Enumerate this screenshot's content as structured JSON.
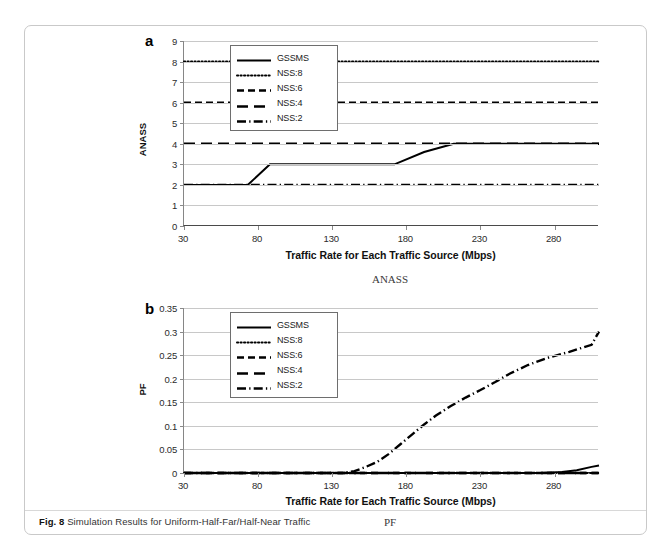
{
  "figure": {
    "caption_bold": "Fig. 8",
    "caption_text": "Simulation Results for Uniform-Half-Far/Half-Near Traffic"
  },
  "panels": [
    {
      "letter": "a",
      "sublabel": "ANASS",
      "axis_title_x": "Traffic Rate for Each Traffic Source (Mbps)",
      "axis_title_y": "ANASS",
      "ytick_labels": [
        "9",
        "8",
        "7",
        "6",
        "5",
        "4",
        "3",
        "2",
        "1",
        "0"
      ],
      "xtick_labels": [
        "30",
        "80",
        "130",
        "180",
        "230",
        "280"
      ],
      "legend": [
        {
          "label": "GSSMS",
          "style": "solid"
        },
        {
          "label": "NSS:8",
          "style": "dotted"
        },
        {
          "label": "NSS:6",
          "style": "dashed"
        },
        {
          "label": "NSS:4",
          "style": "longdash"
        },
        {
          "label": "NSS:2",
          "style": "dashdot"
        }
      ]
    },
    {
      "letter": "b",
      "sublabel": "PF",
      "axis_title_x": "Traffic Rate for Each Traffic Source (Mbps)",
      "axis_title_y": "PF",
      "ytick_labels": [
        "0.35",
        "0.3",
        "0.25",
        "0.2",
        "0.15",
        "0.1",
        "0.05",
        "0"
      ],
      "xtick_labels": [
        "30",
        "80",
        "130",
        "180",
        "230",
        "280"
      ],
      "legend": [
        {
          "label": "GSSMS",
          "style": "solid"
        },
        {
          "label": "NSS:8",
          "style": "dotted"
        },
        {
          "label": "NSS:6",
          "style": "dashed"
        },
        {
          "label": "NSS:4",
          "style": "longdash"
        },
        {
          "label": "NSS:2",
          "style": "dashdot"
        }
      ]
    }
  ],
  "chart_data": [
    {
      "type": "line",
      "title": "ANASS",
      "panel": "a",
      "xlabel": "Traffic Rate for Each Traffic Source (Mbps)",
      "ylabel": "ANASS",
      "xlim": [
        30,
        310
      ],
      "ylim": [
        0,
        9
      ],
      "yticks": [
        0,
        1,
        2,
        3,
        4,
        5,
        6,
        7,
        8,
        9
      ],
      "xticks": [
        30,
        80,
        130,
        180,
        230,
        280
      ],
      "grid": true,
      "legend_position": "top-left-inside",
      "series": [
        {
          "name": "GSSMS",
          "style": "solid",
          "x": [
            30,
            73,
            88,
            172,
            192,
            212,
            310
          ],
          "values": [
            2,
            2,
            3,
            3,
            3.6,
            4,
            4
          ]
        },
        {
          "name": "NSS:8",
          "style": "dotted",
          "x": [
            30,
            310
          ],
          "values": [
            8,
            8
          ]
        },
        {
          "name": "NSS:6",
          "style": "dashed",
          "x": [
            30,
            310
          ],
          "values": [
            6,
            6
          ]
        },
        {
          "name": "NSS:4",
          "style": "longdash",
          "x": [
            30,
            310
          ],
          "values": [
            4,
            4
          ]
        },
        {
          "name": "NSS:2",
          "style": "dashdot",
          "x": [
            30,
            310
          ],
          "values": [
            2,
            2
          ]
        }
      ]
    },
    {
      "type": "line",
      "title": "PF",
      "panel": "b",
      "xlabel": "Traffic Rate for Each Traffic Source (Mbps)",
      "ylabel": "PF",
      "xlim": [
        30,
        310
      ],
      "ylim": [
        0,
        0.35
      ],
      "yticks": [
        0,
        0.05,
        0.1,
        0.15,
        0.2,
        0.25,
        0.3,
        0.35
      ],
      "xticks": [
        30,
        80,
        130,
        180,
        230,
        280
      ],
      "grid": true,
      "legend_position": "top-left-inside",
      "series": [
        {
          "name": "GSSMS",
          "style": "solid",
          "x": [
            30,
            130,
            230,
            270,
            285,
            295,
            305,
            310
          ],
          "values": [
            0,
            0,
            0,
            0,
            0.002,
            0.006,
            0.013,
            0.016
          ]
        },
        {
          "name": "NSS:8",
          "style": "dotted",
          "x": [
            30,
            310
          ],
          "values": [
            0,
            0
          ]
        },
        {
          "name": "NSS:6",
          "style": "dashed",
          "x": [
            30,
            310
          ],
          "values": [
            0,
            0
          ]
        },
        {
          "name": "NSS:4",
          "style": "longdash",
          "x": [
            30,
            310
          ],
          "values": [
            0,
            0
          ]
        },
        {
          "name": "NSS:2",
          "style": "dashdot",
          "x": [
            30,
            137,
            145,
            152,
            160,
            168,
            176,
            184,
            192,
            200,
            210,
            220,
            230,
            240,
            250,
            262,
            275,
            290,
            305,
            310
          ],
          "values": [
            0,
            0,
            0.004,
            0.012,
            0.023,
            0.04,
            0.061,
            0.082,
            0.103,
            0.122,
            0.142,
            0.16,
            0.176,
            0.193,
            0.211,
            0.229,
            0.244,
            0.257,
            0.272,
            0.3
          ]
        }
      ]
    }
  ]
}
